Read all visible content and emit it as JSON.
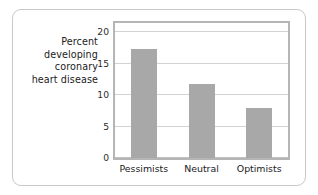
{
  "chart_data": {
    "type": "bar",
    "title": "",
    "subtitle": "",
    "xlabel": "",
    "ylabel": "Percent developing coronary heart disease",
    "ylabel_lines": [
      "Percent",
      "developing",
      "coronary",
      "heart disease"
    ],
    "categories": [
      "Pessimists",
      "Neutral",
      "Optimists"
    ],
    "values": [
      17.3,
      11.8,
      8.0
    ],
    "ylim": [
      0,
      21.5
    ],
    "yticks": [
      0,
      5,
      10,
      15,
      20
    ],
    "ytick_labels": [
      "0",
      "5",
      "10",
      "15",
      "20"
    ],
    "grid": true,
    "grid_axis": "y",
    "legend": false,
    "legend_position": "none",
    "bar_color": "#a8a8a8",
    "plot_border_color": "#b5b5b5",
    "gridline_color": "#d2d2d2",
    "frame_color": "#c9c9c9",
    "background": "#ffffff"
  }
}
